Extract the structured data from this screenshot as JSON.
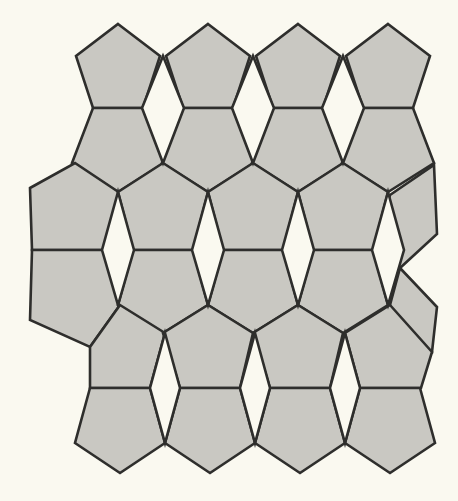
{
  "figure": {
    "caption": "",
    "width": 458,
    "height": 501
  },
  "colors": {
    "background": "#faf9f0",
    "tile_fill": "#c9c8c2",
    "tile_stroke": "#2e2e2c",
    "gap_fill": "#faf9f0",
    "page": "#ffffff"
  },
  "style": {
    "stroke_width": 2.6,
    "outer_margin_left": 0,
    "outer_margin_top": 0
  },
  "geometry": {
    "description": "Irregular pentagon tessellation in 6 horizontal bands with rhombic voids",
    "column_spacing": 90,
    "apex_columns": [
      118,
      208,
      298,
      388
    ],
    "band_y": [
      24,
      56,
      108,
      163,
      192,
      250,
      305,
      333,
      388,
      443,
      473
    ],
    "rows": 6,
    "columns": 4,
    "void_shape": "rhombus",
    "void_count": 9
  },
  "shapes": {
    "pentagons": [
      {
        "name": "r1c1",
        "points": "118,24 160,56 145,108 95,108 77,56"
      },
      {
        "name": "r1c2",
        "points": "208,24 250,56 235,108 185,108 165,56"
      },
      {
        "name": "r1c3",
        "points": "298,24 341,57 326,110 276,110 255,57"
      },
      {
        "name": "r1c4",
        "points": "388,24 431,57 416,110 366,110 345,57"
      },
      {
        "name": "r2c1",
        "points": "95,108 145,108 164,163 120,193 75,163"
      },
      {
        "name": "r2c2",
        "points": "185,108 235,108 254,163 210,193 165,163"
      },
      {
        "name": "r2c3",
        "points": "276,110 326,110 345,165 300,195 255,165"
      },
      {
        "name": "r2c4",
        "points": "366,110 416,110 434,165 390,195 345,165"
      },
      {
        "name": "r3c0",
        "points": "75,163 120,193 105,250 32,250 30,188"
      },
      {
        "name": "r3c1",
        "points": "165,163 210,193 195,250 120,250 120,193"
      },
      {
        "name": "r3c2",
        "points": "255,165 300,195 285,250 210,250 210,193"
      },
      {
        "name": "r3c3",
        "points": "345,165 390,195 375,250 300,250 300,195"
      },
      {
        "name": "r3c4",
        "points": "434,165 437,232 400,268 375,250 390,195"
      },
      {
        "name": "r4c0",
        "points": "32,250 105,250 120,305 90,345 30,318"
      },
      {
        "name": "r4c1",
        "points": "120,250 195,250 210,305 165,333 120,305"
      },
      {
        "name": "r4c2",
        "points": "210,250 285,250 300,305 255,333 210,305"
      },
      {
        "name": "r4c3",
        "points": "300,250 375,250 390,305 345,333 300,305"
      },
      {
        "name": "r4c4",
        "points": "400,268 437,305 432,350 390,333 390,305"
      },
      {
        "name": "r5c1",
        "points": "120,305 165,333 150,388 90,388 90,345"
      },
      {
        "name": "r5c2",
        "points": "210,305 255,333 240,388 180,388 165,333"
      },
      {
        "name": "r5c3",
        "points": "300,305 345,333 330,388 270,388 255,333"
      },
      {
        "name": "r5c4",
        "points": "390,305 432,350 421,388 360,388 345,333"
      },
      {
        "name": "r6c1",
        "points": "90,388 150,388 165,443 120,473 75,443"
      },
      {
        "name": "r6c2",
        "points": "180,388 240,388 255,443 210,473 165,443"
      },
      {
        "name": "r6c3",
        "points": "270,388 330,388 345,443 300,473 255,443"
      },
      {
        "name": "r6c4",
        "points": "360,388 421,388 434,443 390,473 345,443"
      }
    ],
    "voids": [
      {
        "name": "void-r1-a",
        "points": "165,56 185,108 165,163 145,108"
      },
      {
        "name": "void-r1-b",
        "points": "255,57 276,110 255,165 235,108"
      },
      {
        "name": "void-r1-c",
        "points": "345,57 366,110 345,165 326,110"
      },
      {
        "name": "void-r3-a",
        "points": "120,193 120,250 105,250 120,193"
      },
      {
        "name": "void-r3-b",
        "points": "210,193 210,250 195,250 210,193"
      },
      {
        "name": "void-r3-c",
        "points": "300,195 300,250 285,250 300,195"
      },
      {
        "name": "void-r3-d",
        "points": "390,195 390,250 375,250 390,195"
      },
      {
        "name": "void-r5-a",
        "points": "165,333 180,388 165,443 150,388"
      },
      {
        "name": "void-r5-b",
        "points": "255,333 270,388 255,443 240,388"
      },
      {
        "name": "void-r5-c",
        "points": "345,333 360,388 345,443 330,388"
      }
    ]
  }
}
